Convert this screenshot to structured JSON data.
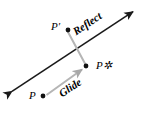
{
  "figure": {
    "background_color": "#ffffff",
    "labels": {
      "p_prime": "P′",
      "p_star": "P✲",
      "p": "P",
      "reflect": "Reflect",
      "glide": "Glide"
    },
    "colors": {
      "mirror_line": "#1a1a1a",
      "reflect_connector": "#b5b5b5",
      "glide_arrow": "#b5b5b5",
      "point_dot": "#111111"
    },
    "geometry": {
      "mirror_line": {
        "from": [
          8,
          94
        ],
        "to": [
          137,
          9
        ],
        "double_headed": true,
        "stroke_width": 1.6
      },
      "reflect_connector": {
        "from": [
          68,
          31
        ],
        "to": [
          86,
          65
        ],
        "stroke_width": 2.0
      },
      "glide_arrow": {
        "from": [
          45,
          96
        ],
        "to": [
          84,
          68
        ],
        "stroke_width": 2.0,
        "arrowhead": "end"
      },
      "points": [
        {
          "name": "p_prime",
          "cx": 68,
          "cy": 30,
          "r": 2.4
        },
        {
          "name": "p_star",
          "cx": 86,
          "cy": 66,
          "r": 2.4
        },
        {
          "name": "p",
          "cx": 43,
          "cy": 96,
          "r": 2.4
        }
      ]
    }
  }
}
